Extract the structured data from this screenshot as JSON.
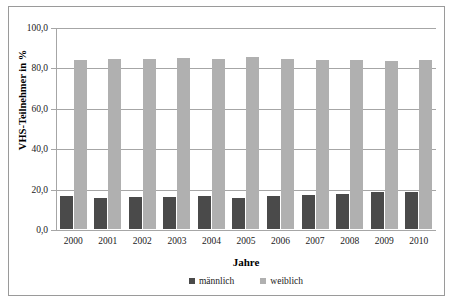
{
  "chart_data": {
    "type": "bar",
    "title": "",
    "xlabel": "Jahre",
    "ylabel": "VHS-Teilnehmer in %",
    "ylim": [
      0,
      100
    ],
    "yticks": [
      "0,0",
      "20,0",
      "40,0",
      "60,0",
      "80,0",
      "100,0"
    ],
    "ytick_values": [
      0,
      20,
      40,
      60,
      80,
      100
    ],
    "grid": true,
    "legend_position": "bottom",
    "categories": [
      "2000",
      "2001",
      "2002",
      "2003",
      "2004",
      "2005",
      "2006",
      "2007",
      "2008",
      "2009",
      "2010"
    ],
    "series": [
      {
        "name": "männlich",
        "color": "#4a4a4a",
        "values": [
          16.1,
          15.6,
          15.7,
          16.0,
          16.2,
          15.4,
          16.4,
          16.9,
          17.2,
          18.1,
          18.2
        ]
      },
      {
        "name": "weiblich",
        "color": "#b0b0b0",
        "values": [
          83.9,
          84.4,
          84.3,
          84.7,
          84.4,
          85.0,
          84.2,
          83.8,
          83.6,
          83.1,
          83.5
        ]
      }
    ]
  },
  "axis": {
    "y_title": "VHS-Teilnehmer in %",
    "x_title": "Jahre"
  },
  "legend": {
    "items": [
      {
        "label": "männlich",
        "color": "#4a4a4a"
      },
      {
        "label": "weiblich",
        "color": "#b0b0b0"
      }
    ]
  },
  "colors": {
    "maennlich": "#4a4a4a",
    "weiblich": "#b0b0b0",
    "gridline": "#a6a6a6",
    "frame": "#9a9a9a"
  }
}
